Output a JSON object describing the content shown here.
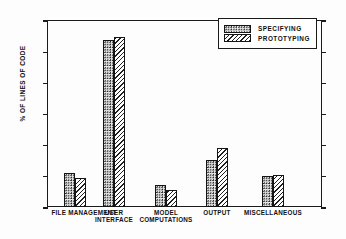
{
  "chart_data": {
    "type": "bar",
    "title": "",
    "xlabel": "",
    "ylabel": "% OF LINES OF CODE",
    "ylim": [
      0,
      60
    ],
    "yticks": [
      0,
      10,
      20,
      30,
      40,
      50,
      60
    ],
    "ytick_labels": [
      "0",
      "10",
      "20",
      "30",
      "40",
      "50",
      "60"
    ],
    "grid": false,
    "legend_position": "top-right",
    "categories": [
      "FILE MANAGEMENT",
      "USER\nINTERFACE",
      "MODEL\nCOMPUTATIONS",
      "OUTPUT",
      "MISCELLANEOUS"
    ],
    "series": [
      {
        "name": "SPECIFYING",
        "values": [
          10.8,
          53.5,
          7.0,
          15.0,
          10.0
        ]
      },
      {
        "name": "PROTOTYPING",
        "values": [
          9.2,
          54.5,
          5.5,
          19.0,
          10.2
        ]
      }
    ]
  },
  "legend": {
    "items": [
      {
        "label": "SPECIFYING",
        "pattern": "dotted-stipple"
      },
      {
        "label": "PROTOTYPING",
        "pattern": "diagonal-hatch"
      }
    ]
  },
  "colors": {
    "axis": "#1a1a1a",
    "text": "#111111",
    "background": "#ffffff"
  }
}
